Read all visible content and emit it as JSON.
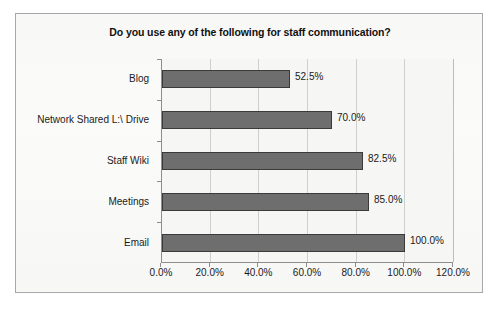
{
  "chart_data": {
    "type": "bar",
    "orientation": "horizontal",
    "title": "Do you use any of the following for staff communication?",
    "categories": [
      "Blog",
      "Network Shared L:\\ Drive",
      "Staff Wiki",
      "Meetings",
      "Email"
    ],
    "values": [
      52.5,
      70.0,
      82.5,
      85.0,
      100.0
    ],
    "value_labels": [
      "52.5%",
      "70.0%",
      "82.5%",
      "85.0%",
      "100.0%"
    ],
    "xlabel": "",
    "ylabel": "",
    "xlim": [
      0,
      120
    ],
    "xticks": [
      0,
      20,
      40,
      60,
      80,
      100,
      120
    ],
    "xtick_labels": [
      "0.0%",
      "20.0%",
      "40.0%",
      "60.0%",
      "80.0%",
      "100.0%",
      "120.0%"
    ],
    "grid": true,
    "grid_axis": "x",
    "legend": false,
    "bar_color": "#6e6e6e",
    "bar_border_color": "#3a3a3a",
    "plot_background": "#f6f6f4",
    "frame_background": "#fbfbfa",
    "axis_color": "#8d8d8d",
    "gridline_color": "#cfcfcf",
    "text_color": "#1a1a1a"
  }
}
